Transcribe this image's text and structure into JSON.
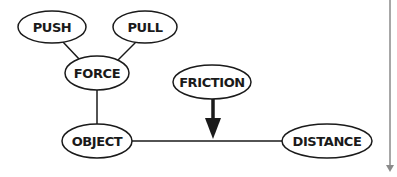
{
  "diagram": {
    "type": "concept-map",
    "nodes": [
      {
        "id": "push",
        "label": "PUSH",
        "cx": 52,
        "cy": 27,
        "rx": 34,
        "ry": 16
      },
      {
        "id": "pull",
        "label": "PULL",
        "cx": 145,
        "cy": 27,
        "rx": 32,
        "ry": 16
      },
      {
        "id": "force",
        "label": "FORCE",
        "cx": 97,
        "cy": 73,
        "rx": 32,
        "ry": 17
      },
      {
        "id": "friction",
        "label": "FRICTION",
        "cx": 212,
        "cy": 82,
        "rx": 39,
        "ry": 17
      },
      {
        "id": "object",
        "label": "OBJECT",
        "cx": 97,
        "cy": 141,
        "rx": 35,
        "ry": 17
      },
      {
        "id": "distance",
        "label": "DISTANCE",
        "cx": 327,
        "cy": 141,
        "rx": 45,
        "ry": 17
      }
    ],
    "edges": [
      {
        "from": "push",
        "to": "force",
        "style": "line"
      },
      {
        "from": "pull",
        "to": "force",
        "style": "line"
      },
      {
        "from": "force",
        "to": "object",
        "style": "line"
      },
      {
        "from": "object",
        "to": "distance",
        "style": "line"
      },
      {
        "from": "friction",
        "to": "object-distance-edge",
        "style": "bold-arrow"
      }
    ],
    "scroll_indicator": {
      "x": 390,
      "y1": 0,
      "y2": 172,
      "color": "#8a8a8a"
    },
    "colors": {
      "stroke": "#1a1a1a",
      "background": "#ffffff",
      "scroll": "#8a8a8a"
    }
  }
}
